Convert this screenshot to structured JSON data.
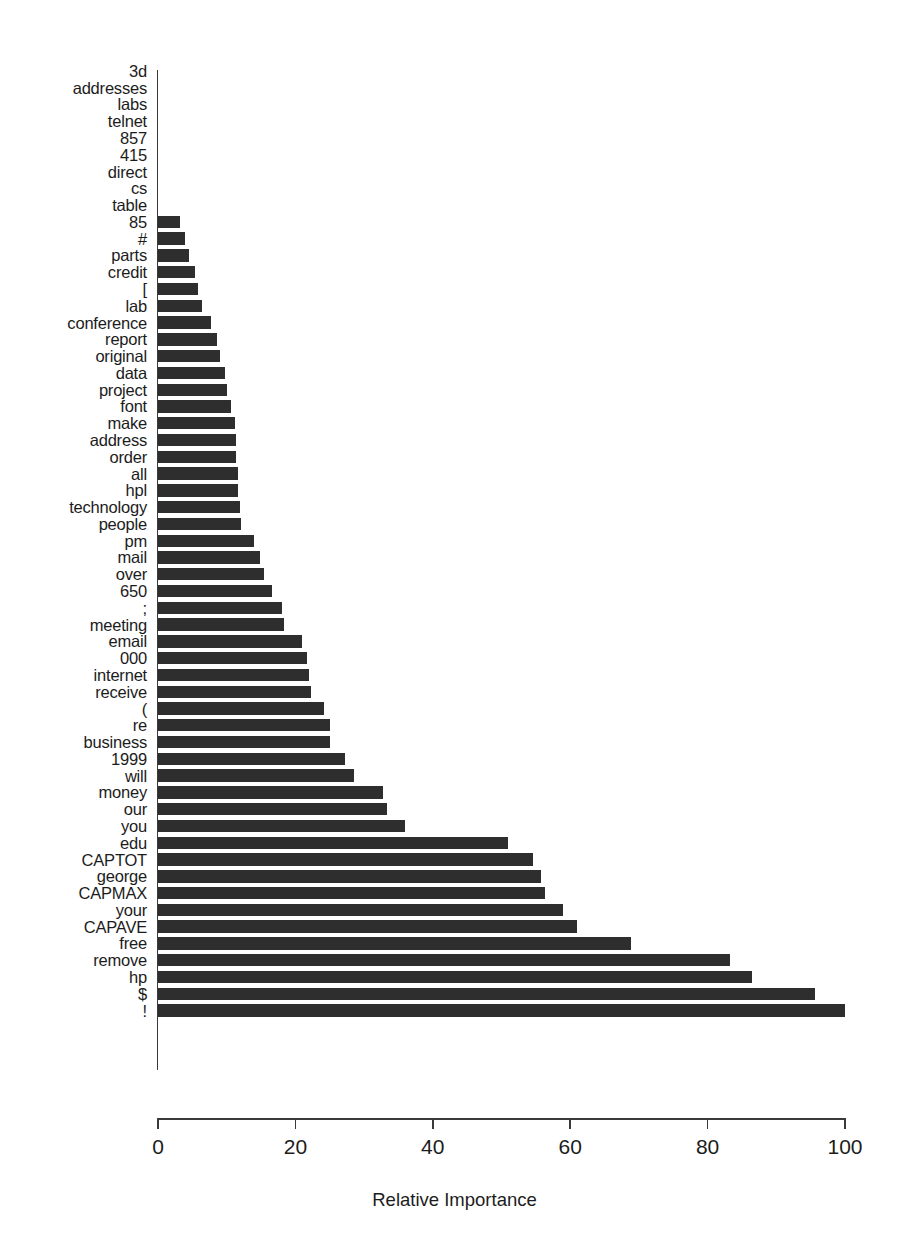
{
  "chart_data": {
    "type": "bar",
    "orientation": "horizontal",
    "title": "",
    "subtitle": "",
    "xlabel": "Relative Importance",
    "ylabel": "",
    "xlim": [
      0,
      100
    ],
    "ylim": null,
    "grid": false,
    "legend": null,
    "bar_color": "#2e2e2e",
    "axis_color": "#3a3a3a",
    "background": "#ffffff",
    "xticks": [
      0,
      20,
      40,
      60,
      80,
      100
    ],
    "xtick_labels": [
      "0",
      "20",
      "40",
      "60",
      "80",
      "100"
    ],
    "categories": [
      "3d",
      "addresses",
      "labs",
      "telnet",
      "857",
      "415",
      "direct",
      "cs",
      "table",
      "85",
      "#",
      "parts",
      "credit",
      "[",
      "lab",
      "conference",
      "report",
      "original",
      "data",
      "project",
      "font",
      "make",
      "address",
      "order",
      "all",
      "hpl",
      "technology",
      "people",
      "pm",
      "mail",
      "over",
      "650",
      ";",
      "meeting",
      "email",
      "000",
      "internet",
      "receive",
      "(",
      "re",
      "business",
      "1999",
      "will",
      "money",
      "our",
      "you",
      "edu",
      "CAPTOT",
      "george",
      "CAPMAX",
      "your",
      "CAPAVE",
      "free",
      "remove",
      "hp",
      "$",
      "!"
    ],
    "values": [
      0.0,
      0.0,
      0.0,
      0.0,
      0.0,
      0.0,
      0.0,
      0.0,
      0.0,
      3.2,
      3.9,
      4.5,
      5.4,
      5.8,
      6.4,
      7.7,
      8.6,
      9.0,
      9.7,
      10.0,
      10.6,
      11.2,
      11.3,
      11.4,
      11.6,
      11.7,
      11.9,
      12.1,
      14.0,
      14.8,
      15.4,
      16.6,
      18.0,
      18.3,
      20.9,
      21.7,
      22.0,
      22.2,
      24.1,
      25.0,
      25.1,
      27.2,
      28.6,
      32.8,
      33.4,
      35.9,
      50.9,
      54.6,
      55.8,
      56.4,
      58.9,
      61.0,
      68.8,
      83.3,
      86.4,
      95.6,
      100.0
    ]
  },
  "axis": {
    "x_title": "Relative Importance"
  }
}
